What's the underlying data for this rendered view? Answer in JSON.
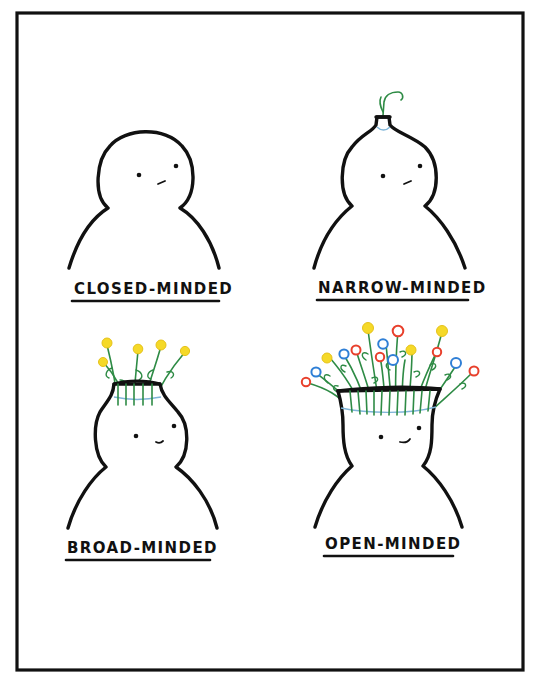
{
  "illustration": {
    "description": "Four-panel cartoon comparing minds as vases/jars with flowers",
    "colors": {
      "frame": "#111111",
      "background": "#ffffff",
      "stem": "#2e8b45",
      "band": "#7fb5d8",
      "flower_yellow": "#f5d928",
      "flower_red": "#e8402c",
      "flower_blue": "#2f7fd6"
    },
    "panels": [
      {
        "id": "closed",
        "label": "CLOSED-MINDED",
        "head": "closed round head, no opening",
        "expression": "neutral"
      },
      {
        "id": "narrow",
        "label": "NARROW-MINDED",
        "head": "narrow bottle neck with a single sprout",
        "expression": "neutral"
      },
      {
        "id": "broad",
        "label": "BROAD-MINDED",
        "head": "medium jar opening with five yellow flowers",
        "expression": "slight smile"
      },
      {
        "id": "open",
        "label": "OPEN-MINDED",
        "head": "wide vase opening with many yellow, red and blue flowers",
        "expression": "smile"
      }
    ]
  }
}
